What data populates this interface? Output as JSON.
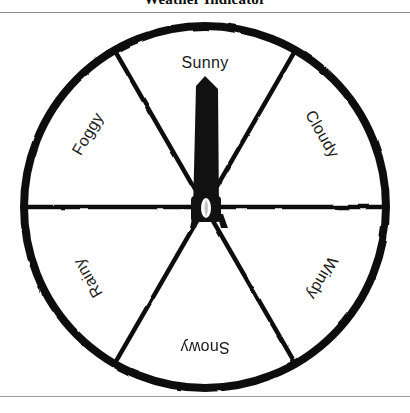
{
  "document": {
    "title": "Weather Indicator"
  },
  "dial": {
    "name": "weather-indicator-dial",
    "center_x": 205,
    "center_y": 207,
    "radius": 181,
    "sector_count": 6,
    "stroke_color": "#111111",
    "background_color": "#ffffff",
    "needle": {
      "name": "pointer-needle",
      "points_to": "Sunny",
      "angle_degrees": 0,
      "color": "#111111"
    },
    "hub": {
      "name": "needle-hub",
      "color": "#111111",
      "opening_color": "#ffffff"
    },
    "sectors": [
      {
        "label": "Sunny",
        "angle_degrees": 0,
        "rotation": 0,
        "label_x": 205,
        "label_y": 63,
        "selected": true
      },
      {
        "label": "Cloudy",
        "angle_degrees": 60,
        "rotation": 60,
        "label_x": 322,
        "label_y": 134,
        "selected": false
      },
      {
        "label": "Windy",
        "angle_degrees": 120,
        "rotation": 120,
        "label_x": 322,
        "label_y": 278,
        "selected": false
      },
      {
        "label": "Snowy",
        "angle_degrees": 180,
        "rotation": 180,
        "label_x": 205,
        "label_y": 347,
        "selected": false
      },
      {
        "label": "Rainy",
        "angle_degrees": 240,
        "rotation": -120,
        "label_x": 88,
        "label_y": 278,
        "selected": false
      },
      {
        "label": "Foggy",
        "angle_degrees": 300,
        "rotation": -60,
        "label_x": 88,
        "label_y": 134,
        "selected": false
      }
    ]
  },
  "rules": {
    "top_color": "#8c8c8c",
    "bottom_color": "#9a9a9a"
  }
}
